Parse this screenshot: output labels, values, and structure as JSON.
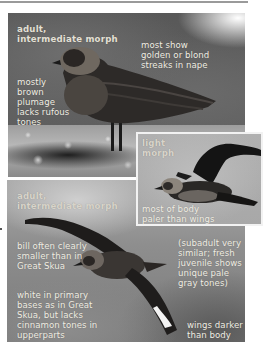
{
  "page": {
    "background": "#ffffff",
    "caption_color": "#f1eee4"
  },
  "photos": {
    "top": {
      "subject": "perched-skua",
      "heading": "adult,\nintermediate morph",
      "annotations": [
        "most show\ngolden or blond\nstreaks in nape",
        "mostly\nbrown\nplumage\nlacks rufous\ntones"
      ]
    },
    "inset": {
      "subject": "flying-skua-light-morph",
      "heading": "light\nmorph",
      "annotations": [
        "most of body\npaler than wings"
      ]
    },
    "bottom": {
      "subject": "flying-skua",
      "heading": "adult,\nintermediate morph",
      "annotations": [
        "bill often clearly\nsmaller than in\nGreat Skua",
        "(subadult very\nsimilar; fresh\njuvenile shows\nunique pale\ngray tones)",
        "white in primary\nbases as in Great\nSkua, but lacks\ncinnamon tones in\nupperparts",
        "wings darker\nthan body"
      ]
    }
  }
}
